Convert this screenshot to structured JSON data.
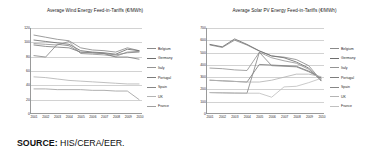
{
  "source": {
    "label": "SOURCE:",
    "value": "HIS/CERA/EER."
  },
  "charts": [
    {
      "id": "wind",
      "title": "Average Wind Energy Feed-in-Tariffs (€/MWh)",
      "legend_position": "right"
    },
    {
      "id": "solar",
      "title": "Average Solar PV Energy Feed-in-Tariffs (€/MWh)",
      "legend_position": "right"
    }
  ],
  "chart_data": [
    {
      "type": "line",
      "title": "Average Wind Energy Feed-in-Tariffs (€/MWh)",
      "xlabel": "",
      "ylabel": "",
      "grid": true,
      "legend": "right",
      "x": [
        "2001",
        "2002",
        "2003",
        "2004",
        "2005",
        "2006",
        "2007",
        "2008",
        "2009",
        "2010"
      ],
      "ylim": [
        0,
        120
      ],
      "yticks": [
        0,
        20,
        40,
        60,
        80,
        100,
        120
      ],
      "series": [
        {
          "name": "Belgium",
          "color": "#8a8a8a",
          "values": [
            110,
            107,
            104,
            102,
            92,
            89,
            88,
            86,
            92,
            88
          ]
        },
        {
          "name": "Germany",
          "color": "#6e6e6e",
          "values": [
            103,
            101,
            99,
            97,
            88,
            86,
            85,
            83,
            90,
            88
          ]
        },
        {
          "name": "Italy",
          "color": "#949494",
          "values": [
            98,
            97,
            96,
            101,
            84,
            83,
            82,
            80,
            86,
            87
          ]
        },
        {
          "name": "Portugal",
          "color": "#7d7d7d",
          "values": [
            96,
            94,
            93,
            92,
            86,
            85,
            84,
            79,
            79,
            76
          ]
        },
        {
          "name": "Spain",
          "color": "#878787",
          "values": [
            81,
            79,
            97,
            95,
            85,
            85,
            84,
            82,
            85,
            86
          ]
        },
        {
          "name": "UK",
          "color": "#b4b4b4",
          "values": [
            51,
            50,
            48,
            46,
            45,
            44,
            43,
            42,
            41,
            41
          ]
        },
        {
          "name": "France",
          "color": "#a0a0a0",
          "values": [
            34,
            34,
            33,
            33,
            33,
            32,
            32,
            31,
            31,
            19
          ]
        }
      ]
    },
    {
      "type": "line",
      "title": "Average Solar PV Energy Feed-in-Tariffs (€/MWh)",
      "xlabel": "",
      "ylabel": "",
      "grid": true,
      "legend": "right",
      "x": [
        "2001",
        "2002",
        "2003",
        "2004",
        "2005",
        "2006",
        "2007",
        "2008",
        "2009",
        "2010"
      ],
      "ylim": [
        0,
        700
      ],
      "yticks": [
        0,
        100,
        200,
        300,
        400,
        500,
        600,
        700
      ],
      "series": [
        {
          "name": "Belgium",
          "color": "#8a8a8a",
          "values": [
            560,
            540,
            600,
            560,
            510,
            470,
            460,
            440,
            390,
            270
          ]
        },
        {
          "name": "Germany",
          "color": "#6e6e6e",
          "values": [
            565,
            545,
            610,
            565,
            512,
            470,
            455,
            420,
            370,
            265
          ]
        },
        {
          "name": "Italy",
          "color": "#949494",
          "values": [
            370,
            365,
            355,
            350,
            500,
            455,
            430,
            410,
            360,
            280
          ]
        },
        {
          "name": "Portugal",
          "color": "#7d7d7d",
          "values": [
            270,
            265,
            260,
            255,
            400,
            395,
            390,
            385,
            345,
            290
          ]
        },
        {
          "name": "Spain",
          "color": "#878787",
          "values": [
            168,
            166,
            164,
            163,
            500,
            390,
            385,
            380,
            340,
            285
          ]
        },
        {
          "name": "UK",
          "color": "#b4b4b4",
          "values": [
            270,
            265,
            260,
            255,
            255,
            270,
            295,
            320,
            320,
            300
          ]
        },
        {
          "name": "France",
          "color": "#c0c0c0",
          "values": [
            168,
            166,
            164,
            163,
            163,
            130,
            215,
            220,
            250,
            285
          ]
        }
      ]
    }
  ]
}
